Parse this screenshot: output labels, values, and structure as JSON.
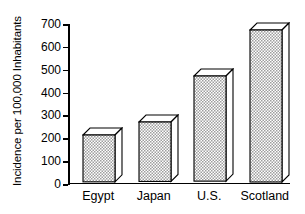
{
  "chart_data": {
    "type": "bar",
    "title": "",
    "subtitle": "",
    "xlabel": "",
    "ylabel": "Incidence per 100,000 Inhabitants",
    "categories": [
      "Egypt",
      "Japan",
      "U.S.",
      "Scotland"
    ],
    "values": [
      205,
      260,
      460,
      665
    ],
    "series": [
      {
        "name": "Incidence",
        "values": [
          205,
          260,
          460,
          665
        ]
      }
    ],
    "ylim": [
      0,
      700
    ],
    "ytick_values": [
      0,
      100,
      200,
      300,
      400,
      500,
      600,
      700
    ],
    "ytick_labels": [
      "0",
      "100",
      "200",
      "300",
      "400",
      "500",
      "600",
      "700"
    ],
    "grid": false,
    "legend": false,
    "legend_position": "none",
    "style": {
      "bar_face_color": "#d9d9d9",
      "bar_edge_color": "#000000",
      "bar_fill_pattern": "stipple",
      "three_d": true,
      "background": "#ffffff",
      "axis_color": "#000000"
    },
    "annotations": []
  }
}
